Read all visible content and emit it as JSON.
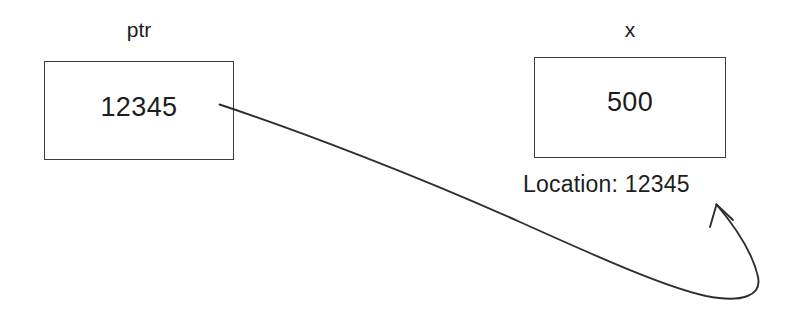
{
  "diagram": {
    "background_color": "#ffffff",
    "stroke_color": "#2e2e2e",
    "text_color": "#1d1d1d",
    "pointer_box": {
      "label": "ptr",
      "value": "12345"
    },
    "target_box": {
      "label": "x",
      "value": "500",
      "location_text": "Location: 12345"
    },
    "arrow": {
      "name": "pointer-to-location-arrow",
      "from": "ptr box right edge",
      "to": "Location: 12345 label",
      "style": "curved hand-drawn line with arrowhead"
    }
  }
}
